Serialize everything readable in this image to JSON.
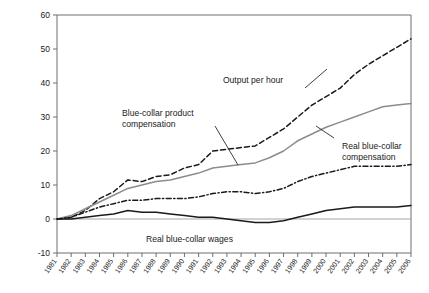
{
  "chart_data": {
    "type": "line",
    "title": "",
    "xlabel": "",
    "ylabel": "",
    "grid": false,
    "legend_position": "inline-annotations",
    "xlim": [
      1981,
      2006
    ],
    "ylim": [
      -10,
      60
    ],
    "yticks": [
      -10,
      0,
      10,
      20,
      30,
      40,
      50,
      60
    ],
    "ytick_labels": [
      "-10",
      "0",
      "10",
      "20",
      "30",
      "40",
      "50",
      "60"
    ],
    "x": [
      1981,
      1982,
      1983,
      1984,
      1985,
      1986,
      1987,
      1988,
      1989,
      1990,
      1991,
      1992,
      1993,
      1994,
      1995,
      1996,
      1997,
      1998,
      1999,
      2000,
      2001,
      2002,
      2003,
      2004,
      2005,
      2006
    ],
    "xtick_labels": [
      "1981",
      "1982",
      "1983",
      "1984",
      "1985",
      "1986",
      "1987",
      "1988",
      "1989",
      "1990",
      "1991",
      "1992",
      "1993",
      "1994",
      "1995",
      "1996",
      "1997",
      "1998",
      "1999",
      "2000",
      "2001",
      "2002",
      "2003",
      "2004",
      "2005",
      "2006"
    ],
    "series": [
      {
        "name": "Output per hour",
        "style": "dashed",
        "color": "#1a1a1a",
        "values": [
          0,
          0.5,
          2.5,
          6.0,
          8.0,
          11.5,
          11.0,
          12.5,
          13.0,
          15.0,
          16.0,
          20.0,
          20.5,
          21.0,
          21.5,
          24.0,
          26.5,
          30.0,
          33.5,
          36.0,
          38.5,
          42.5,
          45.5,
          48.0,
          50.5,
          53.0
        ]
      },
      {
        "name": "Blue-collar product compensation",
        "style": "solid-gray",
        "color": "#8c8c8c",
        "values": [
          0,
          1.0,
          3.0,
          5.0,
          7.0,
          9.0,
          10.0,
          11.0,
          11.5,
          12.5,
          13.5,
          15.0,
          15.5,
          16.0,
          16.5,
          18.0,
          20.0,
          23.0,
          25.0,
          27.0,
          28.5,
          30.0,
          31.5,
          33.0,
          33.5,
          34.0
        ]
      },
      {
        "name": "Real blue-collar compensation",
        "style": "dash-dot",
        "color": "#1a1a1a",
        "values": [
          0,
          0.5,
          2.0,
          3.5,
          4.5,
          5.5,
          5.5,
          6.0,
          6.0,
          6.0,
          6.5,
          7.5,
          8.0,
          8.0,
          7.5,
          8.0,
          9.0,
          11.0,
          12.5,
          13.5,
          14.5,
          15.5,
          15.5,
          15.5,
          15.5,
          16.0
        ]
      },
      {
        "name": "Real blue-collar wages",
        "style": "solid-black",
        "color": "#1a1a1a",
        "values": [
          0,
          0.0,
          0.5,
          1.0,
          1.5,
          2.5,
          2.0,
          2.0,
          1.5,
          1.0,
          0.5,
          0.5,
          0.0,
          -0.5,
          -1.0,
          -1.0,
          -0.5,
          0.5,
          1.5,
          2.5,
          3.0,
          3.5,
          3.5,
          3.5,
          3.5,
          4.0
        ]
      }
    ],
    "annotations": [
      {
        "name": "output-per-hour",
        "text": "Output per hour",
        "x_px": 253,
        "y_px": 83
      },
      {
        "name": "blue-collar-product-compensation",
        "line1": "Blue-collar product",
        "line2": "compensation",
        "x_px": 122,
        "y_px": 116
      },
      {
        "name": "real-blue-collar-compensation",
        "line1": "Real blue-collar",
        "line2": "compensation",
        "x_px": 342,
        "y_px": 149
      },
      {
        "name": "real-blue-collar-wages",
        "text": "Real blue-collar wages",
        "x_px": 146,
        "y_px": 242
      }
    ]
  }
}
